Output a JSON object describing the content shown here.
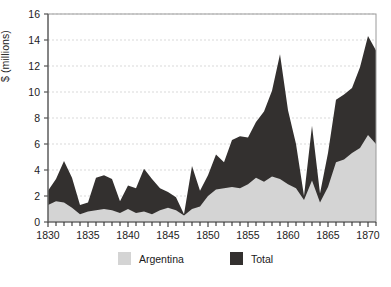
{
  "chart_data": {
    "type": "area",
    "title": "",
    "xlabel": "",
    "ylabel": "$ (millions)",
    "xlim": [
      1830,
      1871
    ],
    "ylim": [
      0,
      16
    ],
    "yticks": [
      0,
      2,
      4,
      6,
      8,
      10,
      12,
      14,
      16
    ],
    "xticks": [
      1830,
      1835,
      1840,
      1845,
      1850,
      1855,
      1860,
      1865,
      1870
    ],
    "xtick_labels": [
      "1830",
      "1835",
      "1840",
      "1845",
      "1850",
      "1855",
      "1860",
      "1865",
      "1870"
    ],
    "ytick_labels": [
      "0",
      "2",
      "4",
      "6",
      "8",
      "10",
      "12",
      "14",
      "16"
    ],
    "grid": true,
    "grid_axis": "y",
    "legend_position": "bottom",
    "stacked": false,
    "colors": {
      "argentina": "#d4d4d4",
      "total": "#33302f",
      "axis": "#6e6e6e",
      "grid": "#d9d9d9",
      "background": "#ffffff"
    },
    "x": [
      1830,
      1831,
      1832,
      1833,
      1834,
      1835,
      1836,
      1837,
      1838,
      1839,
      1840,
      1841,
      1842,
      1843,
      1844,
      1845,
      1846,
      1847,
      1848,
      1849,
      1850,
      1851,
      1852,
      1853,
      1854,
      1855,
      1856,
      1857,
      1858,
      1859,
      1860,
      1861,
      1862,
      1863,
      1864,
      1865,
      1866,
      1867,
      1868,
      1869,
      1870,
      1871
    ],
    "series": [
      {
        "name": "Total",
        "color": "#33302f",
        "values": [
          2.4,
          3.3,
          4.7,
          3.4,
          1.3,
          1.5,
          3.4,
          3.6,
          3.3,
          1.6,
          2.8,
          2.6,
          4.1,
          3.3,
          2.6,
          2.3,
          1.9,
          0.6,
          4.3,
          2.4,
          3.6,
          5.2,
          4.6,
          6.3,
          6.6,
          6.5,
          7.7,
          8.5,
          10.1,
          12.9,
          8.6,
          6.0,
          2.0,
          7.4,
          2.2,
          5.3,
          9.4,
          9.8,
          10.3,
          11.9,
          14.3,
          13.2
        ]
      },
      {
        "name": "Argentina",
        "color": "#d4d4d4",
        "values": [
          1.3,
          1.6,
          1.5,
          1.1,
          0.6,
          0.8,
          0.9,
          1.0,
          0.9,
          0.7,
          1.0,
          0.7,
          0.8,
          0.6,
          0.9,
          1.1,
          0.9,
          0.5,
          1.0,
          1.2,
          2.0,
          2.5,
          2.6,
          2.7,
          2.6,
          2.9,
          3.4,
          3.1,
          3.5,
          3.3,
          2.9,
          2.6,
          1.7,
          3.2,
          1.5,
          2.7,
          4.6,
          4.8,
          5.3,
          5.7,
          6.7,
          6.0
        ]
      }
    ]
  },
  "legend": {
    "entries": [
      {
        "label": "Argentina",
        "swatch": "argentina-swatch"
      },
      {
        "label": "Total",
        "swatch": "total-swatch"
      }
    ]
  },
  "axis": {
    "y_title": "$ (millions)"
  }
}
